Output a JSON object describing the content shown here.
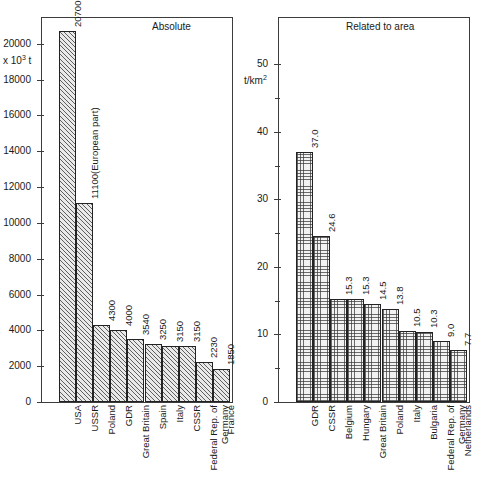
{
  "figure": {
    "width": 484,
    "height": 485,
    "background": "#ffffff",
    "axis_color": "#3c3c3c",
    "text_color": "#1a1a1a"
  },
  "chart_data": [
    {
      "type": "bar",
      "panel": "left",
      "title": "Absolute",
      "ylabel": "x 10³ t",
      "unit_base": "x 10",
      "unit_exp": "3",
      "unit_suffix": " t",
      "xlabel": "",
      "ylim": [
        0,
        21500
      ],
      "yticks": [
        0,
        2000,
        4000,
        6000,
        8000,
        10000,
        12000,
        14000,
        16000,
        18000,
        20000
      ],
      "ytick_labels": [
        "0",
        "2000",
        "4000",
        "6000",
        "8000",
        "10000",
        "12000",
        "14000",
        "16000",
        "18000",
        "20000"
      ],
      "minor_yticks": [],
      "grid": false,
      "legend": "none",
      "categories": [
        "USA",
        "USSR",
        "Poland",
        "GDR",
        "Great Britain",
        "Spain",
        "Italy",
        "CSSR",
        "Federal Rep. of Germany",
        "France"
      ],
      "category_lines": [
        [
          "USA"
        ],
        [
          "USSR"
        ],
        [
          "Poland"
        ],
        [
          "GDR"
        ],
        [
          "Great Britain"
        ],
        [
          "Spain"
        ],
        [
          "Italy"
        ],
        [
          "CSSR"
        ],
        [
          "Federal Rep. of",
          "Germany"
        ],
        [
          "France"
        ]
      ],
      "values": [
        20700,
        11100,
        4300,
        4000,
        3540,
        3250,
        3150,
        3150,
        2230,
        1850
      ],
      "data_labels": [
        "20700",
        "11100(European part)",
        "4300",
        "4000",
        "3540",
        "3250",
        "3150",
        "3150",
        "2230",
        "1850"
      ]
    },
    {
      "type": "bar",
      "panel": "right",
      "title": "Related to area",
      "ylabel": "t/km²",
      "unit_base": "t/km",
      "unit_exp": "2",
      "unit_suffix": "",
      "xlabel": "",
      "ylim": [
        0,
        57
      ],
      "yticks": [
        0,
        10,
        20,
        30,
        40,
        50
      ],
      "ytick_labels": [
        "0",
        "10",
        "20",
        "30",
        "40",
        "50"
      ],
      "minor_yticks": [
        5,
        15,
        25,
        35,
        45
      ],
      "grid": false,
      "legend": "none",
      "categories": [
        "GDR",
        "CSSR",
        "Belgium",
        "Hungary",
        "Great Britain",
        "Poland",
        "Italy",
        "Bulgaria",
        "Federal Rep. of Germany",
        "Netherlands"
      ],
      "category_lines": [
        [
          "GDR"
        ],
        [
          "CSSR"
        ],
        [
          "Belgium"
        ],
        [
          "Hungary"
        ],
        [
          "Great Britain"
        ],
        [
          "Poland"
        ],
        [
          "Italy"
        ],
        [
          "Bulgaria"
        ],
        [
          "Federal Rep. of",
          "Germany"
        ],
        [
          "Netherlands"
        ]
      ],
      "values": [
        37.0,
        24.6,
        15.3,
        15.3,
        14.5,
        13.8,
        10.5,
        10.3,
        9.0,
        7.7
      ],
      "data_labels": [
        "37.0",
        "24.6",
        "15.3",
        "15.3",
        "14.5",
        "13.8",
        "10.5",
        "10.3",
        "9.0",
        "7.7"
      ]
    }
  ]
}
